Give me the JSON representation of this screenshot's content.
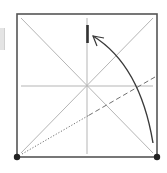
{
  "diagram": {
    "type": "origami-fold-step",
    "colors": {
      "paper_edge": "#555555",
      "crease": "#b5b5b5",
      "fold_line": "#707070",
      "arrow": "#3a3a3a",
      "dot": "#222222",
      "mark": "#333333",
      "side_strip": "#e4e4e4"
    },
    "square": {
      "x1": 17,
      "y1": 14,
      "x2": 157,
      "y2": 157
    },
    "center": {
      "x": 87,
      "y": 86
    },
    "creases": [
      {
        "name": "diagonal-tl-br",
        "x1": 21,
        "y1": 18,
        "x2": 153,
        "y2": 153
      },
      {
        "name": "diagonal-bl-tr",
        "x1": 21,
        "y1": 153,
        "x2": 153,
        "y2": 18
      },
      {
        "name": "vertical-center",
        "x1": 87,
        "y1": 18,
        "x2": 87,
        "y2": 154
      },
      {
        "name": "horizontal-center",
        "x1": 21,
        "y1": 86,
        "x2": 153,
        "y2": 86
      }
    ],
    "fold_line": {
      "x1": 22,
      "y1": 154,
      "x2": 155,
      "y2": 77,
      "style": "dot-then-dash"
    },
    "reference_mark": {
      "x": 87.5,
      "y1": 25,
      "y2": 43
    },
    "arrow": {
      "start": {
        "x": 153,
        "y": 143
      },
      "control": {
        "x": 140,
        "y": 65
      },
      "end": {
        "x": 93,
        "y": 36
      }
    },
    "corner_dots": [
      {
        "name": "bottom-left-dot",
        "x": 17,
        "y": 157
      },
      {
        "name": "bottom-right-dot",
        "x": 157,
        "y": 157
      }
    ]
  }
}
